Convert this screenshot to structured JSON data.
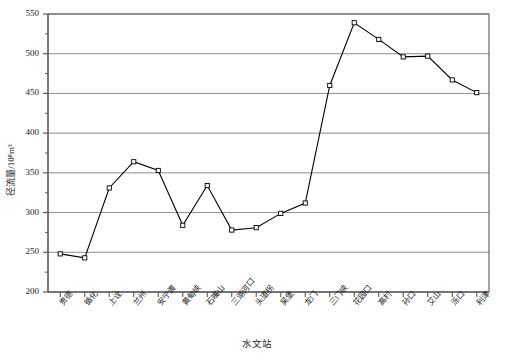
{
  "chart_data": {
    "type": "line",
    "title": "",
    "xlabel": "水文站",
    "ylabel": "径流量/10⁸m³",
    "categories": [
      "贵德",
      "循化",
      "上诠",
      "兰州",
      "安宁渡",
      "黄甸峡",
      "石嘴山",
      "三湖河口",
      "头道拐",
      "吴堡",
      "龙门",
      "三门峡",
      "花园口",
      "高村",
      "孙口",
      "艾山",
      "泺口",
      "利津"
    ],
    "values": [
      248,
      243,
      331,
      364,
      353,
      284,
      334,
      278,
      281,
      299,
      312,
      460,
      539,
      518,
      496,
      497,
      467,
      451
    ],
    "ylim": [
      200,
      550
    ],
    "ytick_labels": [
      "200",
      "250",
      "300",
      "350",
      "400",
      "450",
      "500",
      "550"
    ],
    "ytick_values": [
      200,
      250,
      300,
      350,
      400,
      450,
      500,
      550
    ],
    "grid": true,
    "legend": "none",
    "marker": "open-square",
    "line_color": "#000000",
    "grid_color": "#808080",
    "axis_color": "#595959",
    "marker_fill": "#ffffff"
  }
}
